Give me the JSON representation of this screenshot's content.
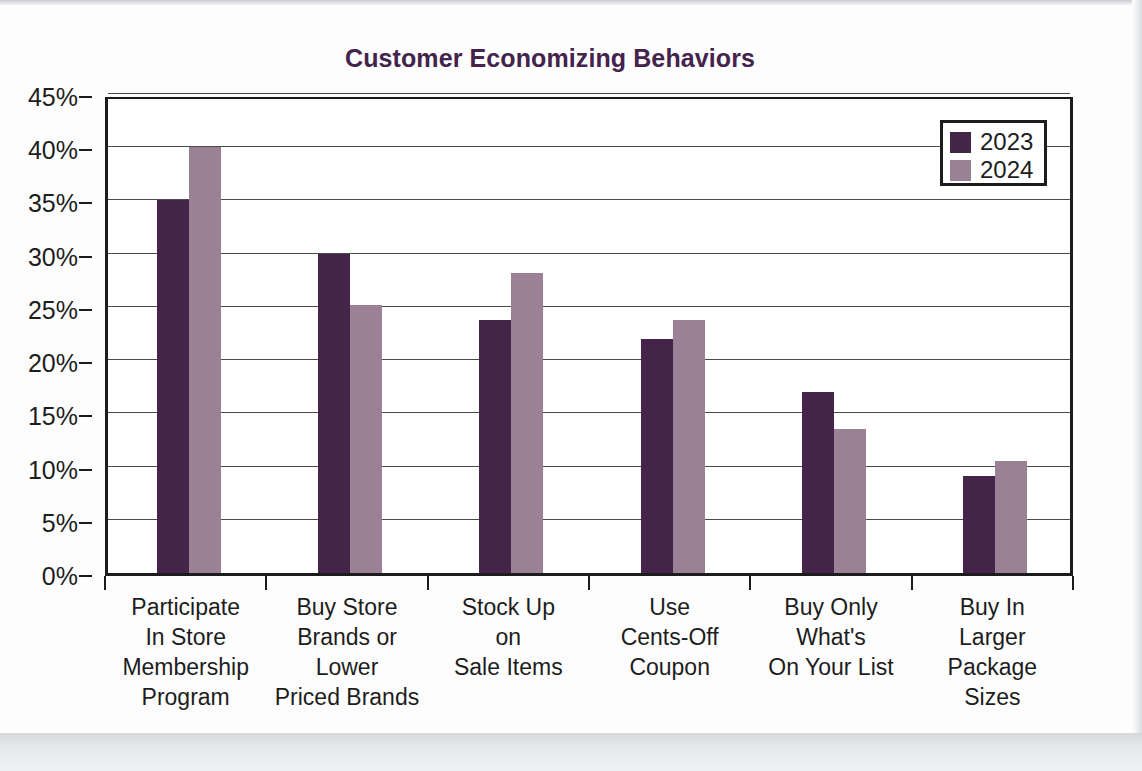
{
  "chart_data": {
    "type": "bar",
    "title": "Customer Economizing Behaviors",
    "xlabel": "",
    "ylabel": "",
    "ylim": [
      0,
      45
    ],
    "y_ticks": [
      "0%",
      "5%",
      "10%",
      "15%",
      "20%",
      "25%",
      "30%",
      "35%",
      "40%",
      "45%"
    ],
    "y_tick_values": [
      0,
      5,
      10,
      15,
      20,
      25,
      30,
      35,
      40,
      45
    ],
    "grid": true,
    "legend_position": "top-right",
    "categories": [
      "Participate In Store Membership Program",
      "Buy Store Brands or Lower Priced Brands",
      "Stock Up on Sale Items",
      "Use Cents-Off Coupon",
      "Buy Only What's On Your List",
      "Buy In Larger Package Sizes"
    ],
    "category_lines": [
      [
        "Participate",
        "In Store",
        "Membership",
        "Program"
      ],
      [
        "Buy Store",
        "Brands or",
        "Lower",
        "Priced Brands"
      ],
      [
        "Stock Up",
        "on",
        "Sale Items"
      ],
      [
        "Use",
        "Cents-Off",
        "Coupon"
      ],
      [
        "Buy Only",
        "What's",
        "On Your List"
      ],
      [
        "Buy In",
        "Larger",
        "Package",
        "Sizes"
      ]
    ],
    "series": [
      {
        "name": "2023",
        "color": "#452449",
        "values": [
          35.0,
          30.0,
          23.8,
          22.0,
          17.0,
          9.1
        ]
      },
      {
        "name": "2024",
        "color": "#9a8196",
        "values": [
          40.0,
          25.2,
          28.2,
          23.8,
          13.5,
          10.5
        ]
      }
    ]
  },
  "legend": {
    "entries": [
      {
        "label": "2023",
        "color": "#452449"
      },
      {
        "label": "2024",
        "color": "#9a8196"
      }
    ]
  },
  "colors": {
    "title": "#44234d",
    "series_2023": "#452449",
    "series_2024": "#9a8196",
    "axis": "#1c1c1c",
    "gridline": "#4a4a4a",
    "text": "#1d1d1d",
    "page_background": "#fdfdfd"
  }
}
